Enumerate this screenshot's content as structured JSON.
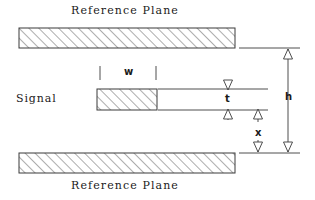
{
  "diagram": {
    "title_top": "Reference  Plane",
    "title_bottom": "Reference  Plane",
    "signal_label": "Signal",
    "dimensions": {
      "w": "w",
      "t": "t",
      "h": "h",
      "x": "x"
    },
    "colors": {
      "line": "#3a3a3a",
      "hatch": "#4a4a4a",
      "fill": "#ffffff",
      "text": "#1a1a1a"
    },
    "geometry": {
      "top_plane": {
        "x": 19,
        "y": 28,
        "w": 216,
        "h": 20
      },
      "bottom_plane": {
        "x": 19,
        "y": 153,
        "w": 216,
        "h": 20
      },
      "signal_trace": {
        "x": 97,
        "y": 89,
        "w": 60,
        "h": 21
      }
    }
  }
}
